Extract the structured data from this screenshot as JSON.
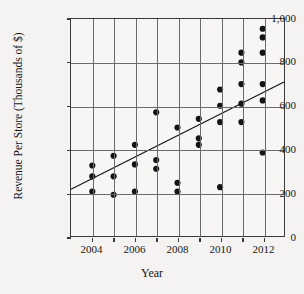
{
  "chart_data": {
    "type": "scatter",
    "title": "Revenue Per Store from 2004 to 2012",
    "xlabel": "Year",
    "ylabel": "Revenue Per Store (Thousands of $)",
    "xlim": [
      2003,
      2013
    ],
    "ylim": [
      0,
      1000
    ],
    "grid": true,
    "legend": "none",
    "x_ticks": [
      2004,
      2006,
      2008,
      2010,
      2012
    ],
    "x_tick_labels": [
      "2004",
      "2006",
      "2008",
      "2010",
      "2012"
    ],
    "x_minor_ticks": [
      2003,
      2005,
      2007,
      2009,
      2011,
      2013
    ],
    "y_ticks": [
      0,
      200,
      400,
      600,
      800,
      1000
    ],
    "y_tick_labels": [
      "0",
      "200",
      "400",
      "600",
      "800",
      "1,000"
    ],
    "points": [
      {
        "x": 2004,
        "y": 205
      },
      {
        "x": 2004,
        "y": 275
      },
      {
        "x": 2004,
        "y": 325
      },
      {
        "x": 2005,
        "y": 190
      },
      {
        "x": 2005,
        "y": 275
      },
      {
        "x": 2005,
        "y": 370
      },
      {
        "x": 2006,
        "y": 205
      },
      {
        "x": 2006,
        "y": 330
      },
      {
        "x": 2006,
        "y": 420
      },
      {
        "x": 2007,
        "y": 310
      },
      {
        "x": 2007,
        "y": 350
      },
      {
        "x": 2007,
        "y": 570
      },
      {
        "x": 2008,
        "y": 205
      },
      {
        "x": 2008,
        "y": 245
      },
      {
        "x": 2008,
        "y": 500
      },
      {
        "x": 2009,
        "y": 420
      },
      {
        "x": 2009,
        "y": 450
      },
      {
        "x": 2009,
        "y": 540
      },
      {
        "x": 2010,
        "y": 225
      },
      {
        "x": 2010,
        "y": 525
      },
      {
        "x": 2010,
        "y": 600
      },
      {
        "x": 2010,
        "y": 675
      },
      {
        "x": 2011,
        "y": 525
      },
      {
        "x": 2011,
        "y": 610
      },
      {
        "x": 2011,
        "y": 700
      },
      {
        "x": 2011,
        "y": 800
      },
      {
        "x": 2011,
        "y": 845
      },
      {
        "x": 2012,
        "y": 385
      },
      {
        "x": 2012,
        "y": 625
      },
      {
        "x": 2012,
        "y": 700
      },
      {
        "x": 2012,
        "y": 845
      },
      {
        "x": 2012,
        "y": 915
      },
      {
        "x": 2012,
        "y": 955
      }
    ],
    "trend_line": {
      "label": "line of best fit",
      "x_start": 2003,
      "y_start": 215,
      "x_end": 2013,
      "y_end": 710
    },
    "marker_color": "#141414",
    "line_color": "#141414",
    "background_color": "#f4f3f1"
  }
}
